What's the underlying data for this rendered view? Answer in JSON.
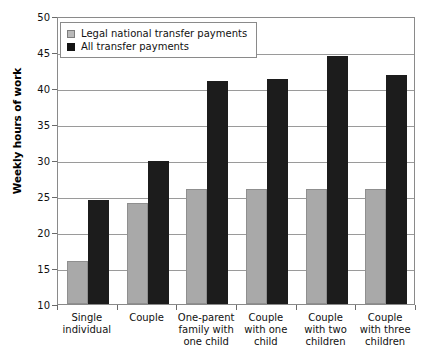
{
  "chart_data": {
    "type": "bar",
    "title": "",
    "xlabel": "",
    "ylabel": "Weekly hours of work",
    "ylim": [
      10,
      50
    ],
    "yticks": [
      10,
      15,
      20,
      25,
      30,
      35,
      40,
      45,
      50
    ],
    "grid": true,
    "legend_position": "top-left",
    "categories": [
      "Single individual",
      "Couple",
      "One-parent family with one child",
      "Couple with one child",
      "Couple with two children",
      "Couple with three children"
    ],
    "category_lines": [
      [
        "Single",
        "individual"
      ],
      [
        "Couple"
      ],
      [
        "One-parent",
        "family with",
        "one child"
      ],
      [
        "Couple",
        "with one",
        "child"
      ],
      [
        "Couple",
        "with two",
        "children"
      ],
      [
        "Couple",
        "with three",
        "children"
      ]
    ],
    "series": [
      {
        "name": "Legal national transfer payments",
        "color": "#a9a9a9",
        "values": [
          16.0,
          24.0,
          26.0,
          26.0,
          26.0,
          26.0
        ]
      },
      {
        "name": "All transfer payments",
        "color": "#1c1c1c",
        "values": [
          24.5,
          29.9,
          41.0,
          41.3,
          44.5,
          41.8
        ]
      }
    ]
  },
  "legend": {
    "entries": [
      {
        "label": "Legal national transfer payments",
        "swatch": "legal-swatch"
      },
      {
        "label": "All transfer payments",
        "swatch": "all-swatch"
      }
    ]
  },
  "axis": {
    "y_title": "Weekly hours of work",
    "y_tick_labels": [
      "10",
      "15",
      "20",
      "25",
      "30",
      "35",
      "40",
      "45",
      "50"
    ]
  }
}
